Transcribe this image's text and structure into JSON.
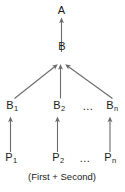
{
  "diagram": {
    "type": "tree",
    "caption": "(First + Second)",
    "nodes": {
      "root": {
        "label": "A",
        "subscript": ""
      },
      "mid": {
        "label": "B",
        "subscript": ""
      },
      "b1": {
        "label": "B",
        "subscript": "1"
      },
      "b2": {
        "label": "B",
        "subscript": "2"
      },
      "bn": {
        "label": "B",
        "subscript": "n"
      },
      "p1": {
        "label": "P",
        "subscript": "1"
      },
      "p2": {
        "label": "P",
        "subscript": "2"
      },
      "pn": {
        "label": "P",
        "subscript": "n"
      }
    },
    "ellipsis": {
      "b_row": "…",
      "p_row": "…"
    },
    "edges": [
      {
        "from": "mid",
        "to": "root",
        "style": "arrow-up-vertical"
      },
      {
        "from": "b1",
        "to": "mid",
        "style": "arrow-diagonal-right-up"
      },
      {
        "from": "b2",
        "to": "mid",
        "style": "arrow-up-vertical"
      },
      {
        "from": "bn",
        "to": "mid",
        "style": "arrow-diagonal-left-up"
      },
      {
        "from": "p1",
        "to": "b1",
        "style": "arrow-up-vertical"
      },
      {
        "from": "p2",
        "to": "b2",
        "style": "arrow-up-vertical"
      },
      {
        "from": "pn",
        "to": "bn",
        "style": "arrow-up-vertical"
      }
    ],
    "colors": {
      "stroke": "#6b6b6b",
      "text": "#1a1a1a",
      "background": "#ffffff"
    }
  }
}
